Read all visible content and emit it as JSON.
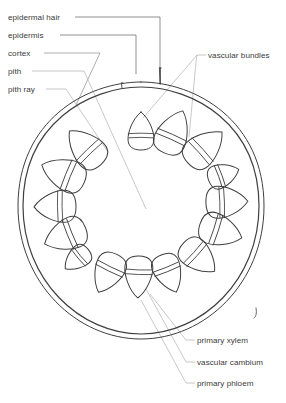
{
  "figure": {
    "type": "botanical-cross-section-diagram"
  },
  "labels": {
    "left": [
      {
        "id": "epidermal-hair",
        "text": "epidermal hair",
        "x": 8,
        "y": 13
      },
      {
        "id": "epidermis",
        "text": "epidermis",
        "x": 8,
        "y": 31
      },
      {
        "id": "cortex",
        "text": "cortex",
        "x": 8,
        "y": 49
      },
      {
        "id": "pith",
        "text": "pith",
        "x": 8,
        "y": 67
      },
      {
        "id": "pith-ray",
        "text": "pith ray",
        "x": 8,
        "y": 85
      }
    ],
    "right": [
      {
        "id": "vascular-bundles",
        "text": "vascular bundles",
        "x": 208,
        "y": 51
      },
      {
        "id": "primary-xylem",
        "text": "primary xylem",
        "x": 197,
        "y": 336
      },
      {
        "id": "vascular-cambium",
        "text": "vascular cambium",
        "x": 197,
        "y": 358
      },
      {
        "id": "primary-phloem",
        "text": "primary phloem",
        "x": 197,
        "y": 379
      }
    ]
  },
  "colors": {
    "outline": "#3f3f3f",
    "leader": "#9a9a9a",
    "leader_dark": "#5e5e5e",
    "text": "#3b3b3b",
    "background": "#ffffff"
  },
  "stem": {
    "center_x": 141,
    "center_y": 205,
    "radius_outer": 123,
    "radius_epidermis": 119,
    "hairs": [
      {
        "x": 122,
        "height": 5
      },
      {
        "x": 160,
        "height": 12
      }
    ]
  },
  "vascular_bundles": [
    {
      "index": 1,
      "angle_deg": -90,
      "rx": 13,
      "ry": 19,
      "distance": 74
    },
    {
      "index": 2,
      "angle_deg": -66,
      "rx": 16,
      "ry": 23,
      "distance": 80
    },
    {
      "index": 3,
      "angle_deg": -42,
      "rx": 16,
      "ry": 23,
      "distance": 86
    },
    {
      "index": 4,
      "angle_deg": -20,
      "rx": 12,
      "ry": 16,
      "distance": 88
    },
    {
      "index": 5,
      "angle_deg": -2,
      "rx": 16,
      "ry": 21,
      "distance": 86
    },
    {
      "index": 6,
      "angle_deg": 18,
      "rx": 16,
      "ry": 22,
      "distance": 84
    },
    {
      "index": 7,
      "angle_deg": 42,
      "rx": 15,
      "ry": 21,
      "distance": 78
    },
    {
      "index": 8,
      "angle_deg": 68,
      "rx": 14,
      "ry": 20,
      "distance": 74
    },
    {
      "index": 9,
      "angle_deg": 92,
      "rx": 14,
      "ry": 21,
      "distance": 72
    },
    {
      "index": 10,
      "angle_deg": 116,
      "rx": 15,
      "ry": 21,
      "distance": 76
    },
    {
      "index": 11,
      "angle_deg": 140,
      "rx": 11,
      "ry": 15,
      "distance": 84
    },
    {
      "index": 12,
      "angle_deg": 158,
      "rx": 16,
      "ry": 22,
      "distance": 82
    },
    {
      "index": 13,
      "angle_deg": 179,
      "rx": 16,
      "ry": 21,
      "distance": 86
    },
    {
      "index": 14,
      "angle_deg": 202,
      "rx": 16,
      "ry": 23,
      "distance": 84
    },
    {
      "index": 15,
      "angle_deg": 226,
      "rx": 16,
      "ry": 23,
      "distance": 80
    }
  ]
}
